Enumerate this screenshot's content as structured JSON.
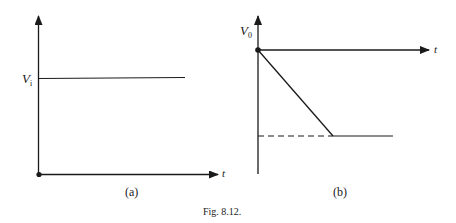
{
  "figure": {
    "caption": "Fig. 8.12."
  },
  "panel_a": {
    "label": "(a)",
    "y_level_label": "V",
    "y_level_subscript": "i",
    "x_axis_label": "t"
  },
  "panel_b": {
    "label": "(b)",
    "y_axis_label": "V",
    "y_axis_subscript": "0",
    "x_axis_label": "t"
  },
  "colors": {
    "ink": "#1a1a1a",
    "background": "#ffffff"
  }
}
